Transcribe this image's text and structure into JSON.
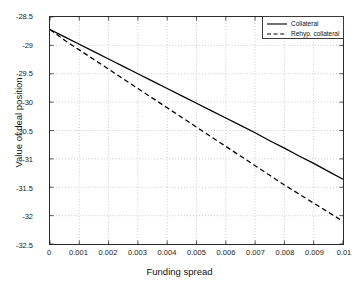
{
  "chart_data": {
    "type": "line",
    "title": "",
    "xlabel": "Funding spread",
    "ylabel": "Value of deal position",
    "xlim": [
      0,
      0.01
    ],
    "ylim": [
      -32.5,
      -28.5
    ],
    "grid": true,
    "legend_position": "top-right",
    "xticks": [
      "0",
      "0.001",
      "0.002",
      "0.003",
      "0.004",
      "0.005",
      "0.006",
      "0.007",
      "0.008",
      "0.009",
      "0.01"
    ],
    "xtick_values": [
      0,
      0.001,
      0.002,
      0.003,
      0.004,
      0.005,
      0.006,
      0.007,
      0.008,
      0.009,
      0.01
    ],
    "yticks": [
      "-28.5",
      "-29",
      "-29.5",
      "-30",
      "-30.5",
      "-31",
      "-31.5",
      "-32",
      "-32.5"
    ],
    "ytick_values": [
      -28.5,
      -29,
      -29.5,
      -30,
      -30.5,
      -31,
      -31.5,
      -32,
      -32.5
    ],
    "x": [
      0,
      0.0005,
      0.001,
      0.0015,
      0.002,
      0.0025,
      0.003,
      0.0035,
      0.004,
      0.0045,
      0.005,
      0.0055,
      0.006,
      0.0065,
      0.007,
      0.0075,
      0.008,
      0.0085,
      0.009,
      0.0095,
      0.01
    ],
    "series": [
      {
        "name": "Collateral",
        "style": "solid",
        "color": "#000000",
        "values": [
          -28.72,
          -28.85,
          -28.98,
          -29.11,
          -29.24,
          -29.37,
          -29.5,
          -29.63,
          -29.76,
          -29.89,
          -30.02,
          -30.15,
          -30.28,
          -30.41,
          -30.54,
          -30.68,
          -30.81,
          -30.95,
          -31.08,
          -31.22,
          -31.36
        ]
      },
      {
        "name": "Rehyp. collateral",
        "style": "dashed",
        "color": "#000000",
        "values": [
          -28.72,
          -28.91,
          -29.08,
          -29.25,
          -29.42,
          -29.59,
          -29.76,
          -29.93,
          -30.1,
          -30.27,
          -30.44,
          -30.61,
          -30.78,
          -30.95,
          -31.12,
          -31.29,
          -31.46,
          -31.62,
          -31.78,
          -31.94,
          -32.1
        ]
      }
    ],
    "legend": [
      {
        "label": "Collateral",
        "style": "solid"
      },
      {
        "label": "Rehyp. collateral",
        "style": "dashed"
      }
    ]
  }
}
